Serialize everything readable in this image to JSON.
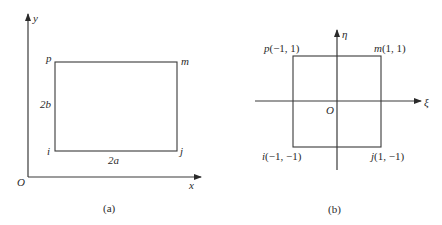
{
  "figure": {
    "panel_a": {
      "caption": "(a)",
      "axes": {
        "x_label": "x",
        "y_label": "y",
        "origin_label": "O"
      },
      "corners": {
        "top_left": "p",
        "top_right": "m",
        "bottom_left": "i",
        "bottom_right": "j"
      },
      "dimensions": {
        "width": "2a",
        "height": "2b"
      }
    },
    "panel_b": {
      "caption": "(b)",
      "axes": {
        "horizontal_label": "ξ",
        "vertical_label": "η",
        "origin_label": "O"
      },
      "corners": {
        "top_left": {
          "name": "p",
          "coords": "(−1, 1)"
        },
        "top_right": {
          "name": "m",
          "coords": "(1, 1)"
        },
        "bottom_left": {
          "name": "i",
          "coords": "(−1, −1)"
        },
        "bottom_right": {
          "name": "j",
          "coords": "(1, −1)"
        }
      }
    },
    "colors": {
      "line": "#3a3a3a",
      "text": "#2a2a2a",
      "background": "#ffffff"
    }
  }
}
